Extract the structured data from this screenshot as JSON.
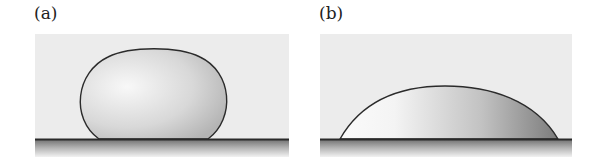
{
  "figure": {
    "panels": [
      {
        "label": "(a)",
        "description": "hydrophobic droplet with high contact angle",
        "drop_shape": "near-spherical"
      },
      {
        "label": "(b)",
        "description": "hydrophilic droplet with low contact angle",
        "drop_shape": "flattened spherical cap"
      }
    ],
    "colors": {
      "background": "#ececec",
      "substrate_line": "#2a2a2a",
      "substrate_shadow": "#8a8a8a",
      "drop_outline": "#2b2b2b",
      "drop_light": "#f6f6f6",
      "drop_dark": "#8c8c8c"
    }
  }
}
